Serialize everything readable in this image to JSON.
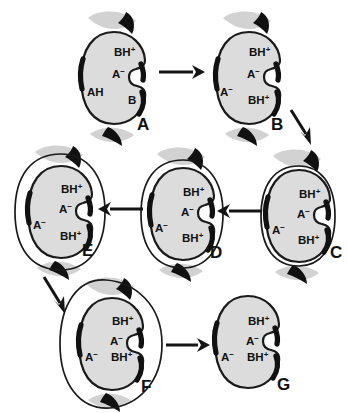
{
  "figure": {
    "panel_count": 7,
    "background_color": "#ffffff",
    "cell_fill_color": "#dcdcdc",
    "outline_color": "#1a1a1a",
    "accent_color": "#111111"
  },
  "panels": [
    {
      "id": "A",
      "letter": "A",
      "letter_x": 137,
      "letter_y": 130,
      "stage": "initial",
      "envelope": "none",
      "labels": [
        {
          "text": "BH",
          "sup": "+",
          "x": 114,
          "y": 56
        },
        {
          "text": "A",
          "sup": "−",
          "x": 112,
          "y": 78
        },
        {
          "text": "AH",
          "sup": "",
          "x": 87,
          "y": 96
        },
        {
          "text": "B",
          "sup": "",
          "x": 128,
          "y": 104
        }
      ]
    },
    {
      "id": "B",
      "letter": "B",
      "letter_x": 271,
      "letter_y": 130,
      "stage": "ionized",
      "envelope": "none",
      "labels": [
        {
          "text": "BH",
          "sup": "+",
          "x": 249,
          "y": 56
        },
        {
          "text": "A",
          "sup": "−",
          "x": 247,
          "y": 78
        },
        {
          "text": "A",
          "sup": "−",
          "x": 220,
          "y": 96
        },
        {
          "text": "BH",
          "sup": "+",
          "x": 248,
          "y": 104
        }
      ]
    },
    {
      "id": "C",
      "letter": "C",
      "letter_x": 330,
      "letter_y": 258,
      "stage": "membrane-forming",
      "envelope": "tight",
      "labels": [
        {
          "text": "BH",
          "sup": "+",
          "x": 299,
          "y": 198
        },
        {
          "text": "A",
          "sup": "−",
          "x": 297,
          "y": 218
        },
        {
          "text": "A",
          "sup": "−",
          "x": 272,
          "y": 234
        },
        {
          "text": "BH",
          "sup": "+",
          "x": 298,
          "y": 244
        }
      ]
    },
    {
      "id": "D",
      "letter": "D",
      "letter_x": 210,
      "letter_y": 258,
      "stage": "membrane-separating",
      "envelope": "narrow",
      "labels": [
        {
          "text": "BH",
          "sup": "+",
          "x": 183,
          "y": 196
        },
        {
          "text": "A",
          "sup": "−",
          "x": 181,
          "y": 216
        },
        {
          "text": "A",
          "sup": "−",
          "x": 155,
          "y": 232
        },
        {
          "text": "BH",
          "sup": "+",
          "x": 182,
          "y": 242
        }
      ]
    },
    {
      "id": "E",
      "letter": "E",
      "letter_x": 82,
      "letter_y": 256,
      "stage": "membrane-detaching",
      "envelope": "wide",
      "labels": [
        {
          "text": "BH",
          "sup": "+",
          "x": 61,
          "y": 193
        },
        {
          "text": "A",
          "sup": "−",
          "x": 59,
          "y": 213
        },
        {
          "text": "A",
          "sup": "−",
          "x": 33,
          "y": 229
        },
        {
          "text": "BH",
          "sup": "+",
          "x": 60,
          "y": 240
        }
      ]
    },
    {
      "id": "F",
      "letter": "F",
      "letter_x": 141,
      "letter_y": 392,
      "stage": "vesicle-release",
      "envelope": "widest",
      "labels": [
        {
          "text": "BH",
          "sup": "+",
          "x": 112,
          "y": 325
        },
        {
          "text": "A",
          "sup": "−",
          "x": 110,
          "y": 345
        },
        {
          "text": "A",
          "sup": "−",
          "x": 85,
          "y": 361
        },
        {
          "text": "BH",
          "sup": "+",
          "x": 111,
          "y": 361
        }
      ]
    },
    {
      "id": "G",
      "letter": "G",
      "letter_x": 277,
      "letter_y": 390,
      "stage": "final",
      "envelope": "none",
      "labels": [
        {
          "text": "BH",
          "sup": "+",
          "x": 248,
          "y": 325
        },
        {
          "text": "A",
          "sup": "−",
          "x": 246,
          "y": 345
        },
        {
          "text": "A",
          "sup": "−",
          "x": 221,
          "y": 361
        },
        {
          "text": "BH",
          "sup": "+",
          "x": 247,
          "y": 361
        }
      ]
    }
  ],
  "arrows": [
    {
      "id": "a-to-b",
      "from": "A",
      "to": "B",
      "direction": "right"
    },
    {
      "id": "b-to-c",
      "from": "B",
      "to": "C",
      "direction": "down-right"
    },
    {
      "id": "c-to-d",
      "from": "C",
      "to": "D",
      "direction": "left"
    },
    {
      "id": "d-to-e",
      "from": "D",
      "to": "E",
      "direction": "left"
    },
    {
      "id": "e-to-f",
      "from": "E",
      "to": "F",
      "direction": "down-right"
    },
    {
      "id": "f-to-g",
      "from": "F",
      "to": "G",
      "direction": "right"
    }
  ]
}
